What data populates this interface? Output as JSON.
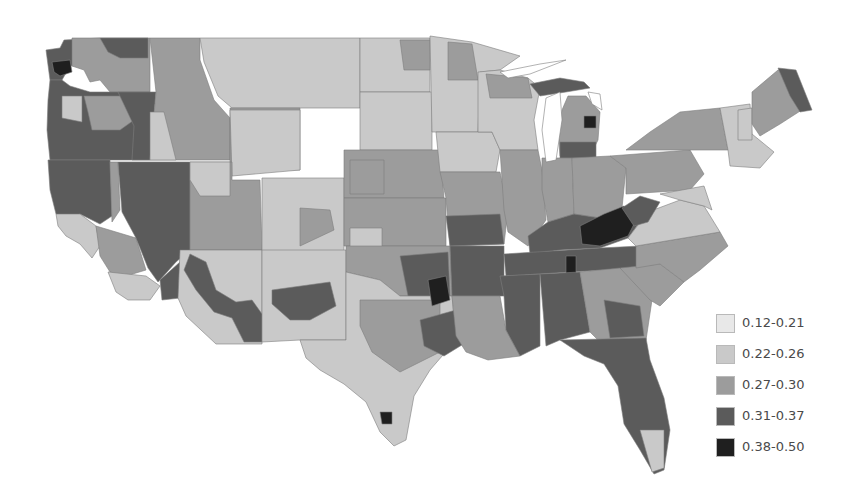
{
  "chart_data": {
    "type": "choropleth",
    "title": "",
    "region": "Contiguous United States (county / area level)",
    "legend_position": "bottom-right",
    "classes": [
      {
        "label": "0.12-0.21",
        "min": 0.12,
        "max": 0.21,
        "color": "#e8e8e8"
      },
      {
        "label": "0.22-0.26",
        "min": 0.22,
        "max": 0.26,
        "color": "#c9c9c9"
      },
      {
        "label": "0.27-0.30",
        "min": 0.27,
        "max": 0.3,
        "color": "#9c9c9c"
      },
      {
        "label": "0.31-0.37",
        "min": 0.31,
        "max": 0.37,
        "color": "#5b5b5b"
      },
      {
        "label": "0.38-0.50",
        "min": 0.38,
        "max": 0.5,
        "color": "#1f1f1f"
      }
    ],
    "regional_pattern": {
      "pacific_northwest_coast": "0.31-0.37 with pockets of 0.38-0.50 (NW Washington)",
      "nevada_oregon_northern_california": "0.31-0.37",
      "northern_plains_dakotas_montana": "0.12-0.21 to 0.22-0.26",
      "southwest_arizona_new_mexico": "0.31-0.37 band across southern AZ/NM",
      "appalachia_kentucky_west_virginia": "0.38-0.50",
      "lower_mississippi_arkansas_oklahoma": "0.31-0.37 with 0.38-0.50 pockets",
      "northeast_new_england": "0.12-0.26, northern Maine 0.31-0.37",
      "southeast_georgia_florida": "mixed 0.27-0.37",
      "south_texas_border": "0.22-0.26 with one 0.38-0.50 county"
    }
  },
  "legend": {
    "items": [
      {
        "label": "0.12-0.21",
        "color": "#e8e8e8"
      },
      {
        "label": "0.22-0.26",
        "color": "#c9c9c9"
      },
      {
        "label": "0.27-0.30",
        "color": "#9c9c9c"
      },
      {
        "label": "0.31-0.37",
        "color": "#5b5b5b"
      },
      {
        "label": "0.38-0.50",
        "color": "#1f1f1f"
      }
    ]
  },
  "map": {
    "regions": [
      {
        "name": "washington-west",
        "cls": 3,
        "d": "M46,50 L60,48 L64,40 L100,38 L100,60 L88,64 L70,66 L62,80 L50,80 Z"
      },
      {
        "name": "washington-nw-dark",
        "cls": 4,
        "d": "M52,62 L70,60 L72,72 L60,76 L54,72 Z"
      },
      {
        "name": "washington-east",
        "cls": 2,
        "d": "M72,38 L150,38 L150,92 L110,92 L100,80 L90,82 L84,70 L72,66 Z"
      },
      {
        "name": "washington-north-dark",
        "cls": 3,
        "d": "M100,38 L148,38 L148,58 L120,58 L108,52 Z"
      },
      {
        "name": "oregon-coast",
        "cls": 3,
        "d": "M50,80 L62,80 L70,86 L90,92 L150,92 L150,160 L50,160 L47,130 L48,100 Z"
      },
      {
        "name": "oregon-interior",
        "cls": 2,
        "d": "M84,96 L132,96 L134,120 L120,130 L92,130 L88,112 Z"
      },
      {
        "name": "oregon-light",
        "cls": 1,
        "d": "M62,96 L82,96 L82,122 L62,118 Z"
      },
      {
        "name": "oregon-east-dark",
        "cls": 3,
        "d": "M118,92 L156,92 L150,160 L132,160 L134,126 Z"
      },
      {
        "name": "california-north-dark",
        "cls": 3,
        "d": "M48,160 L110,160 L112,216 L100,224 L80,214 L66,220 L56,214 L50,190 Z"
      },
      {
        "name": "california-sierra",
        "cls": 2,
        "d": "M110,162 L118,162 L120,210 L112,222 Z"
      },
      {
        "name": "california-bay",
        "cls": 1,
        "d": "M56,214 L80,214 L96,226 L100,246 L92,258 L80,244 L66,236 L58,226 Z"
      },
      {
        "name": "california-central",
        "cls": 2,
        "d": "M96,226 L136,238 L146,270 L126,276 L110,272 L100,256 Z"
      },
      {
        "name": "california-south",
        "cls": 1,
        "d": "M108,272 L146,276 L160,286 L150,300 L128,300 L116,292 Z"
      },
      {
        "name": "california-se-dark",
        "cls": 3,
        "d": "M160,280 L180,262 L188,270 L180,298 L162,300 Z"
      },
      {
        "name": "nevada-dark",
        "cls": 3,
        "d": "M118,162 L190,162 L190,250 L176,262 L158,282 L148,268 L136,238 L122,212 Z"
      },
      {
        "name": "idaho",
        "cls": 2,
        "d": "M150,38 L200,38 L200,60 L214,100 L230,118 L230,160 L150,160 L156,92 Z"
      },
      {
        "name": "idaho-light",
        "cls": 1,
        "d": "M150,112 L164,112 L176,160 L150,160 Z"
      },
      {
        "name": "montana-west",
        "cls": 1,
        "d": "M200,38 L360,38 L360,108 L232,108 L218,96 L204,62 Z"
      },
      {
        "name": "montana-mid",
        "cls": 2,
        "d": "M230,108 L300,108 L300,170 L230,170 Z"
      },
      {
        "name": "wyoming",
        "cls": 1,
        "d": "M230,110 L300,110 L300,170 L232,176 Z"
      },
      {
        "name": "utah",
        "cls": 2,
        "d": "M190,162 L232,162 L232,180 L260,180 L262,250 L190,250 Z"
      },
      {
        "name": "utah-light",
        "cls": 1,
        "d": "M190,162 L230,162 L230,196 L200,196 L190,180 Z"
      },
      {
        "name": "colorado",
        "cls": 1,
        "d": "M262,178 L344,178 L344,252 L262,252 Z"
      },
      {
        "name": "colorado-west-mid",
        "cls": 2,
        "d": "M300,208 L330,210 L334,230 L300,246 Z"
      },
      {
        "name": "arizona",
        "cls": 1,
        "d": "M180,250 L262,250 L262,344 L216,344 L186,316 L178,298 Z"
      },
      {
        "name": "arizona-dark-band",
        "cls": 3,
        "d": "M190,254 L206,262 L216,290 L236,302 L252,300 L262,314 L262,342 L244,342 L232,318 L214,312 L196,290 L184,270 Z"
      },
      {
        "name": "new-mexico",
        "cls": 1,
        "d": "M262,250 L346,250 L346,340 L300,340 L262,342 Z"
      },
      {
        "name": "new-mexico-dark",
        "cls": 3,
        "d": "M272,290 L330,282 L336,306 L310,320 L290,320 L272,304 Z"
      },
      {
        "name": "north-dakota",
        "cls": 1,
        "d": "M360,38 L430,38 L430,92 L360,92 Z"
      },
      {
        "name": "south-dakota",
        "cls": 1,
        "d": "M360,92 L432,92 L432,150 L360,150 Z"
      },
      {
        "name": "dakota-mid",
        "cls": 2,
        "d": "M400,40 L430,40 L430,70 L404,70 Z"
      },
      {
        "name": "nebraska",
        "cls": 2,
        "d": "M344,150 L440,150 L444,198 L344,198 Z"
      },
      {
        "name": "nebraska-dark",
        "cls": 2,
        "d": "M350,160 L384,160 L384,194 L350,194 Z"
      },
      {
        "name": "kansas",
        "cls": 2,
        "d": "M344,198 L446,198 L446,246 L344,246 Z"
      },
      {
        "name": "kansas-light",
        "cls": 1,
        "d": "M350,228 L382,228 L382,248 L350,248 Z"
      },
      {
        "name": "oklahoma",
        "cls": 2,
        "d": "M346,246 L450,246 L452,296 L400,296 L380,280 L346,272 Z"
      },
      {
        "name": "oklahoma-dark",
        "cls": 3,
        "d": "M400,256 L448,252 L450,296 L408,296 Z"
      },
      {
        "name": "texas",
        "cls": 1,
        "d": "M300,340 L346,340 L346,272 L380,280 L400,296 L452,296 L456,340 L430,370 L414,396 L406,440 L394,446 L380,432 L366,402 L344,384 L320,370 L306,358 Z"
      },
      {
        "name": "texas-central",
        "cls": 2,
        "d": "M360,300 L440,300 L440,352 L400,372 L372,352 L360,326 Z"
      },
      {
        "name": "texas-east-dark",
        "cls": 3,
        "d": "M420,320 L456,310 L470,340 L444,356 L424,346 Z"
      },
      {
        "name": "texas-border-dark",
        "cls": 4,
        "d": "M380,412 L392,412 L392,424 L382,424 Z"
      },
      {
        "name": "minnesota",
        "cls": 1,
        "d": "M430,36 L472,42 L520,56 L500,70 L480,72 L478,132 L432,132 Z"
      },
      {
        "name": "minnesota-mid",
        "cls": 2,
        "d": "M448,42 L472,44 L478,80 L448,80 Z"
      },
      {
        "name": "iowa",
        "cls": 1,
        "d": "M436,132 L492,132 L500,150 L496,172 L440,172 Z"
      },
      {
        "name": "missouri",
        "cls": 2,
        "d": "M440,172 L500,172 L508,210 L504,244 L450,246 L446,198 Z"
      },
      {
        "name": "missouri-dark",
        "cls": 3,
        "d": "M446,216 L500,214 L504,244 L450,246 Z"
      },
      {
        "name": "arkansas-dark",
        "cls": 3,
        "d": "M450,246 L504,246 L504,296 L452,296 Z"
      },
      {
        "name": "arkansas-black",
        "cls": 4,
        "d": "M428,280 L446,276 L450,300 L432,306 Z"
      },
      {
        "name": "louisiana",
        "cls": 2,
        "d": "M452,296 L500,296 L506,330 L520,356 L488,360 L466,352 L456,336 Z"
      },
      {
        "name": "wisconsin",
        "cls": 1,
        "d": "M478,72 L500,70 L528,78 L540,88 L534,120 L538,150 L500,150 L492,132 L478,132 Z"
      },
      {
        "name": "wisconsin-north",
        "cls": 2,
        "d": "M486,74 L528,78 L532,98 L490,98 Z"
      },
      {
        "name": "illinois",
        "cls": 2,
        "d": "M500,150 L538,150 L542,170 L546,220 L528,246 L508,232 L504,210 Z"
      },
      {
        "name": "michigan-up-dark",
        "cls": 3,
        "d": "M530,84 L560,78 L584,82 L590,88 L566,92 L540,96 Z"
      },
      {
        "name": "michigan-lp",
        "cls": 2,
        "d": "M568,96 L586,96 L600,112 L598,140 L590,156 L560,156 L558,130 L562,110 Z"
      },
      {
        "name": "michigan-black",
        "cls": 4,
        "d": "M584,116 L596,116 L596,128 L584,128 Z"
      },
      {
        "name": "michigan-dark-band",
        "cls": 3,
        "d": "M560,142 L596,142 L596,158 L560,158 Z"
      },
      {
        "name": "indiana",
        "cls": 2,
        "d": "M542,158 L572,158 L574,214 L548,222 L542,190 Z"
      },
      {
        "name": "ohio",
        "cls": 2,
        "d": "M572,158 L610,156 L626,168 L622,208 L600,218 L574,214 Z"
      },
      {
        "name": "kentucky-dark",
        "cls": 3,
        "d": "M528,236 L548,222 L574,214 L600,218 L622,208 L640,222 L628,238 L600,248 L560,250 L530,254 Z"
      },
      {
        "name": "kentucky-appalachia-black",
        "cls": 4,
        "d": "M580,226 L604,214 L624,206 L638,216 L628,236 L600,246 L582,244 Z"
      },
      {
        "name": "tennessee",
        "cls": 3,
        "d": "M504,254 L600,248 L640,246 L636,268 L506,276 Z"
      },
      {
        "name": "tennessee-black",
        "cls": 4,
        "d": "M566,256 L576,256 L576,288 L566,288 Z"
      },
      {
        "name": "mississippi",
        "cls": 3,
        "d": "M500,276 L540,274 L540,346 L520,356 L506,330 L504,296 Z"
      },
      {
        "name": "alabama",
        "cls": 3,
        "d": "M540,274 L580,272 L590,332 L560,340 L546,346 Z"
      },
      {
        "name": "georgia",
        "cls": 2,
        "d": "M580,272 L620,268 L652,300 L646,340 L600,342 L590,332 Z"
      },
      {
        "name": "georgia-dark",
        "cls": 3,
        "d": "M604,300 L640,306 L644,336 L610,338 Z"
      },
      {
        "name": "florida",
        "cls": 3,
        "d": "M560,340 L646,338 L650,360 L664,398 L670,430 L664,470 L654,474 L640,450 L624,424 L618,386 L604,364 L584,356 Z"
      },
      {
        "name": "florida-light",
        "cls": 1,
        "d": "M640,430 L664,430 L664,468 L652,472 Z"
      },
      {
        "name": "south-carolina",
        "cls": 2,
        "d": "M620,268 L660,264 L684,282 L660,306 L650,300 Z"
      },
      {
        "name": "north-carolina",
        "cls": 2,
        "d": "M636,246 L720,232 L728,246 L700,270 L684,282 L660,264 L636,268 Z"
      },
      {
        "name": "virginia",
        "cls": 1,
        "d": "M628,238 L648,212 L680,200 L704,206 L720,232 L636,246 Z"
      },
      {
        "name": "west-virginia-dark",
        "cls": 3,
        "d": "M622,208 L640,196 L660,202 L648,222 L634,226 Z"
      },
      {
        "name": "pennsylvania",
        "cls": 2,
        "d": "M610,156 L690,150 L704,174 L690,190 L626,194 L626,168 Z"
      },
      {
        "name": "maryland-delaware",
        "cls": 1,
        "d": "M660,194 L704,186 L712,210 L704,206 L680,200 Z"
      },
      {
        "name": "new-york",
        "cls": 2,
        "d": "M626,150 L650,132 L680,112 L720,108 L728,150 L690,150 Z"
      },
      {
        "name": "new-england-light",
        "cls": 1,
        "d": "M720,108 L750,104 L752,134 L774,152 L760,168 L730,166 L728,150 Z"
      },
      {
        "name": "vermont-nh",
        "cls": 1,
        "d": "M738,110 L752,108 L752,140 L738,140 Z"
      },
      {
        "name": "maine",
        "cls": 2,
        "d": "M752,92 L778,70 L796,74 L808,106 L780,124 L760,136 L752,124 Z"
      },
      {
        "name": "maine-north-dark",
        "cls": 3,
        "d": "M778,68 L796,70 L812,110 L800,112 L790,96 Z"
      }
    ]
  }
}
